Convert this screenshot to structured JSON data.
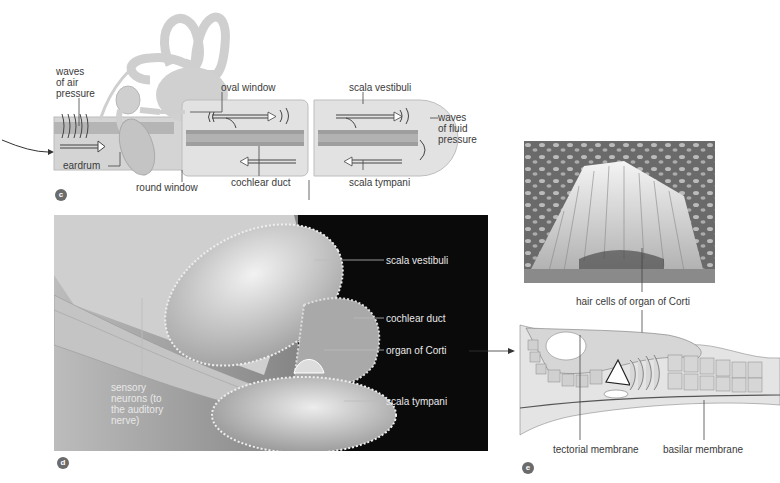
{
  "figure": {
    "panels": {
      "c": {
        "badge": "c",
        "labels": {
          "waves_air": "waves\nof air\npressure",
          "eardrum": "eardrum",
          "oval_window": "oval window",
          "round_window": "round window",
          "cochlear_duct": "cochlear duct",
          "scala_vestibuli": "scala vestibuli",
          "scala_tympani": "scala tympani",
          "waves_fluid": "waves\nof fluid\npressure"
        }
      },
      "d": {
        "badge": "d",
        "labels": {
          "scala_vestibuli": "scala vestibuli",
          "cochlear_duct": "cochlear duct",
          "organ_of_corti": "organ of Corti",
          "scala_tympani": "scala tympani",
          "sensory_neurons": "sensory\nneurons (to\nthe auditory\nnerve)"
        }
      },
      "micrograph": {
        "labels": {
          "hair_cells": "hair cells of organ of Corti"
        }
      },
      "e": {
        "badge": "e",
        "labels": {
          "tectorial_membrane": "tectorial membrane",
          "basilar_membrane": "basilar membrane"
        }
      }
    },
    "colors": {
      "tissue_light": "#e6e6e6",
      "tissue_mid": "#c8c8c8",
      "tissue_dark": "#9a9a9a",
      "background_dark": "#0a0a0a",
      "leader_line": "#444444",
      "badge": "#6b6b6b"
    }
  }
}
